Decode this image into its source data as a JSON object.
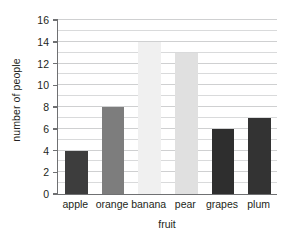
{
  "chart_data": {
    "type": "bar",
    "title": "",
    "xlabel": "fruit",
    "ylabel": "number of people",
    "categories": [
      "apple",
      "orange",
      "banana",
      "pear",
      "grapes",
      "plum"
    ],
    "values": [
      4,
      8,
      14,
      13,
      6,
      7
    ],
    "ylim": [
      0,
      16
    ],
    "ytick_labels": [
      "0",
      "2",
      "4",
      "6",
      "8",
      "10",
      "12",
      "14",
      "16"
    ],
    "ytick_values": [
      0,
      2,
      4,
      6,
      8,
      10,
      12,
      14,
      16
    ],
    "ytick_step": 2,
    "minor_gridline_step": 1,
    "grid": "horizontal",
    "legend": "none",
    "bar_colors": [
      "#3d3d3d",
      "#7d7d7d",
      "#f0f0f0",
      "#e0e0e0",
      "#2e2e2e",
      "#333333"
    ],
    "series": [
      {
        "name": "number of people",
        "points": [
          {
            "category": "apple",
            "value": 4,
            "color": "#3d3d3d"
          },
          {
            "category": "orange",
            "value": 8,
            "color": "#7d7d7d"
          },
          {
            "category": "banana",
            "value": 14,
            "color": "#f0f0f0"
          },
          {
            "category": "pear",
            "value": 13,
            "color": "#e0e0e0"
          },
          {
            "category": "grapes",
            "value": 6,
            "color": "#2e2e2e"
          },
          {
            "category": "plum",
            "value": 7,
            "color": "#333333"
          }
        ]
      }
    ],
    "axis_color": "#6f7072",
    "gridline_color": "#d9dadb",
    "background": "#ffffff"
  }
}
